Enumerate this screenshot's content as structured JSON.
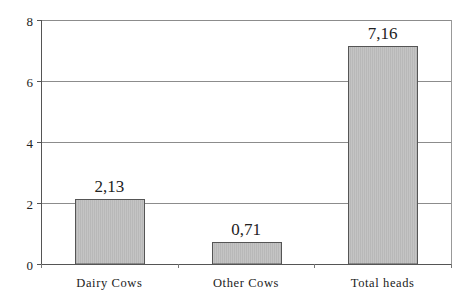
{
  "chart_data": {
    "type": "bar",
    "title": "",
    "xlabel": "",
    "ylabel": "",
    "categories": [
      "Dairy Cows",
      "Other Cows",
      "Total heads"
    ],
    "values": [
      2.13,
      0.71,
      7.16
    ],
    "data_labels": [
      "2,13",
      "0,71",
      "7,16"
    ],
    "ylim": [
      0,
      8
    ],
    "yticks": [
      0,
      2,
      4,
      6,
      8
    ],
    "ytick_labels": [
      "0",
      "2",
      "4",
      "6",
      "8"
    ],
    "grid": true,
    "legend": null,
    "bar_color": "#c0c0c0",
    "bar_edge_color": "#555555",
    "gridline_color": "#8c8c8c"
  }
}
